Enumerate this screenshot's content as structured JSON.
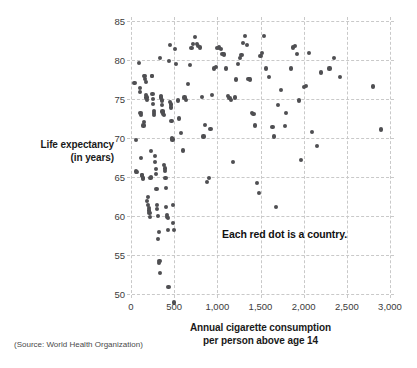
{
  "chart_data": {
    "type": "scatter",
    "title": "",
    "xlabel": "Annual cigarette consumption per person above age 14",
    "ylabel": "Life expectancy (in years)",
    "xlim": [
      0,
      3000
    ],
    "ylim": [
      48,
      85
    ],
    "grid": true,
    "legend": null,
    "annotation": "Each red dot is a country.",
    "source": "(Source: World Health Organization)",
    "xticks": [
      "0",
      "500",
      "1,000",
      "1,500",
      "2,000",
      "2,500",
      "3,000"
    ],
    "xtick_values": [
      0,
      500,
      1000,
      1500,
      2000,
      2500,
      3000
    ],
    "yticks": [
      "50",
      "55",
      "60",
      "65",
      "70",
      "75",
      "80",
      "85"
    ],
    "ytick_values": [
      50,
      55,
      60,
      65,
      70,
      75,
      80,
      85
    ],
    "point_color": "#4f4f52",
    "gridline_color": "#c9c9c9",
    "series": [
      {
        "name": "Countries",
        "points": [
          [
            40,
            77.0
          ],
          [
            55,
            69.7
          ],
          [
            60,
            65.7
          ],
          [
            70,
            65.6
          ],
          [
            95,
            79.6
          ],
          [
            100,
            76.4
          ],
          [
            105,
            75.9
          ],
          [
            110,
            73.2
          ],
          [
            115,
            73.0
          ],
          [
            120,
            67.4
          ],
          [
            125,
            65.3
          ],
          [
            130,
            65.2
          ],
          [
            135,
            64.9
          ],
          [
            140,
            64.8
          ],
          [
            145,
            71.6
          ],
          [
            150,
            72.0
          ],
          [
            155,
            77.9
          ],
          [
            160,
            78.0
          ],
          [
            165,
            77.6
          ],
          [
            170,
            77.2
          ],
          [
            175,
            75.5
          ],
          [
            180,
            75.2
          ],
          [
            185,
            74.9
          ],
          [
            190,
            61.9
          ],
          [
            195,
            62.4
          ],
          [
            200,
            61.4
          ],
          [
            205,
            61.0
          ],
          [
            210,
            60.7
          ],
          [
            215,
            60.4
          ],
          [
            220,
            59.9
          ],
          [
            225,
            64.9
          ],
          [
            230,
            65.0
          ],
          [
            235,
            68.3
          ],
          [
            240,
            78.0
          ],
          [
            245,
            77.9
          ],
          [
            250,
            75.6
          ],
          [
            255,
            75.0
          ],
          [
            258,
            74.4
          ],
          [
            262,
            73.5
          ],
          [
            266,
            73.2
          ],
          [
            270,
            72.9
          ],
          [
            275,
            67.7
          ],
          [
            280,
            66.9
          ],
          [
            285,
            66.0
          ],
          [
            290,
            65.4
          ],
          [
            295,
            63.5
          ],
          [
            300,
            61.4
          ],
          [
            305,
            60.9
          ],
          [
            310,
            60.0
          ],
          [
            315,
            57.0
          ],
          [
            320,
            58.0
          ],
          [
            325,
            54.0
          ],
          [
            330,
            54.2
          ],
          [
            335,
            52.7
          ],
          [
            340,
            80.3
          ],
          [
            345,
            75.4
          ],
          [
            350,
            75.2
          ],
          [
            355,
            74.8
          ],
          [
            360,
            74.2
          ],
          [
            365,
            73.4
          ],
          [
            370,
            73.3
          ],
          [
            375,
            73.1
          ],
          [
            380,
            72.9
          ],
          [
            385,
            66.5
          ],
          [
            390,
            66.1
          ],
          [
            395,
            65.8
          ],
          [
            400,
            64.9
          ],
          [
            405,
            63.6
          ],
          [
            410,
            61.2
          ],
          [
            415,
            60.1
          ],
          [
            420,
            59.9
          ],
          [
            425,
            59.7
          ],
          [
            430,
            58.2
          ],
          [
            435,
            50.9
          ],
          [
            440,
            79.9
          ],
          [
            450,
            81.9
          ],
          [
            455,
            74.6
          ],
          [
            460,
            74.3
          ],
          [
            465,
            73.9
          ],
          [
            470,
            72.2
          ],
          [
            475,
            70.0
          ],
          [
            480,
            69.8
          ],
          [
            485,
            61.4
          ],
          [
            490,
            59.1
          ],
          [
            495,
            58.2
          ],
          [
            500,
            48.9
          ],
          [
            510,
            81.4
          ],
          [
            520,
            79.5
          ],
          [
            540,
            74.8
          ],
          [
            560,
            72.5
          ],
          [
            580,
            70.6
          ],
          [
            600,
            68.4
          ],
          [
            620,
            75.2
          ],
          [
            640,
            74.9
          ],
          [
            660,
            76.9
          ],
          [
            680,
            79.4
          ],
          [
            700,
            81.5
          ],
          [
            720,
            82.1
          ],
          [
            740,
            83.0
          ],
          [
            760,
            82.0
          ],
          [
            780,
            81.8
          ],
          [
            800,
            81.6
          ],
          [
            820,
            75.3
          ],
          [
            840,
            70.2
          ],
          [
            860,
            71.7
          ],
          [
            880,
            64.4
          ],
          [
            900,
            64.9
          ],
          [
            920,
            71.2
          ],
          [
            940,
            75.5
          ],
          [
            960,
            78.9
          ],
          [
            980,
            79.1
          ],
          [
            1000,
            81.5
          ],
          [
            1020,
            81.6
          ],
          [
            1040,
            81.4
          ],
          [
            1060,
            80.8
          ],
          [
            1080,
            80.7
          ],
          [
            1100,
            78.9
          ],
          [
            1120,
            75.4
          ],
          [
            1140,
            75.1
          ],
          [
            1160,
            74.9
          ],
          [
            1180,
            66.9
          ],
          [
            1200,
            75.2
          ],
          [
            1220,
            77.5
          ],
          [
            1240,
            79.5
          ],
          [
            1260,
            80.3
          ],
          [
            1280,
            80.6
          ],
          [
            1300,
            82.2
          ],
          [
            1320,
            83.1
          ],
          [
            1340,
            81.9
          ],
          [
            1360,
            77.6
          ],
          [
            1380,
            77.5
          ],
          [
            1400,
            73.2
          ],
          [
            1420,
            73.1
          ],
          [
            1440,
            71.6
          ],
          [
            1460,
            64.2
          ],
          [
            1480,
            63.0
          ],
          [
            1500,
            80.5
          ],
          [
            1520,
            80.9
          ],
          [
            1540,
            83.1
          ],
          [
            1560,
            78.9
          ],
          [
            1600,
            77.8
          ],
          [
            1640,
            71.4
          ],
          [
            1660,
            70.2
          ],
          [
            1680,
            61.2
          ],
          [
            1700,
            74.2
          ],
          [
            1740,
            76.2
          ],
          [
            1780,
            71.5
          ],
          [
            1800,
            73.2
          ],
          [
            1850,
            78.9
          ],
          [
            1880,
            81.6
          ],
          [
            1900,
            81.8
          ],
          [
            1920,
            80.8
          ],
          [
            1950,
            74.8
          ],
          [
            1970,
            67.2
          ],
          [
            2000,
            76.5
          ],
          [
            2030,
            76.7
          ],
          [
            2060,
            80.9
          ],
          [
            2100,
            70.8
          ],
          [
            2150,
            69.0
          ],
          [
            2200,
            78.4
          ],
          [
            2300,
            78.9
          ],
          [
            2350,
            80.3
          ],
          [
            2420,
            77.8
          ],
          [
            2800,
            76.6
          ],
          [
            2900,
            71.1
          ]
        ]
      }
    ]
  },
  "axes": {
    "y_title_line1": "Life expectancy",
    "y_title_line2": "(in years)",
    "x_title_line1": "Annual cigarette consumption",
    "x_title_line2": "per person above age 14"
  },
  "annotation": {
    "text": "Each red dot is a country."
  },
  "source": {
    "text": "(Source: World Health Organization)"
  }
}
